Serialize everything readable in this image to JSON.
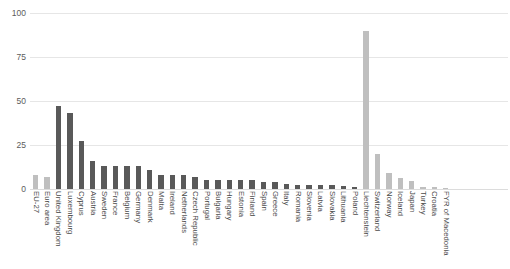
{
  "title_strip": "",
  "chart_data": {
    "type": "bar",
    "title": "",
    "subtitle": "",
    "xlabel": "",
    "ylabel": "",
    "ylim": [
      0,
      100
    ],
    "yticks": [
      "0",
      "25",
      "50",
      "75",
      "100"
    ],
    "ytick_values": [
      0,
      25,
      50,
      75,
      100
    ],
    "grid": true,
    "legend": "none",
    "orientation": "vertical",
    "bar_colors": {
      "aggregate": "#bfbfbf",
      "eu_member": "#595959",
      "non_eu": "#bfbfbf"
    },
    "categories": [
      "EU-27",
      "Euro area",
      "United Kingdom",
      "Luxembourg",
      "Cyprus",
      "Austria",
      "Sweden",
      "France",
      "Belgium",
      "Germany",
      "Denmark",
      "Malta",
      "Ireland",
      "Netherlands",
      "Czech Republic",
      "Portugal",
      "Bulgaria",
      "Hungary",
      "Estonia",
      "Finland",
      "Spain",
      "Greece",
      "Italy",
      "Romania",
      "Slovenia",
      "Latvia",
      "Slovakia",
      "Lithuania",
      "Poland",
      "Liechtenstein",
      "Switzerland",
      "Norway",
      "Iceland",
      "Japan",
      "Turkey",
      "Croatia",
      "FYR of Macedonia"
    ],
    "values": [
      8,
      7,
      47,
      43,
      27,
      16,
      13,
      13,
      13,
      13,
      11,
      8,
      8,
      8,
      7,
      5,
      5,
      5,
      5,
      5,
      4,
      4,
      3,
      2.5,
      2.5,
      2,
      2,
      1.5,
      1,
      90,
      20,
      9,
      6,
      4.5,
      1.2,
      1,
      0.6
    ],
    "series_shades": [
      "light",
      "light",
      "dark",
      "dark",
      "dark",
      "dark",
      "dark",
      "dark",
      "dark",
      "dark",
      "dark",
      "dark",
      "dark",
      "dark",
      "dark",
      "dark",
      "dark",
      "dark",
      "dark",
      "dark",
      "dark",
      "dark",
      "dark",
      "dark",
      "dark",
      "dark",
      "dark",
      "dark",
      "dark",
      "light",
      "light",
      "light",
      "light",
      "light",
      "light",
      "light",
      "light"
    ]
  }
}
